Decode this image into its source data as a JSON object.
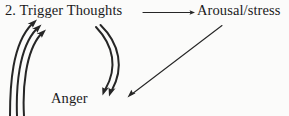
{
  "figure": {
    "kind": "cycle-diagram",
    "background_color": "#fbfbfa",
    "ink_color": "#262626",
    "item_number": "2."
  },
  "nodes": {
    "trigger": {
      "label": "2. Trigger Thoughts"
    },
    "arousal": {
      "label": "Arousal/stress"
    },
    "anger": {
      "label": "Anger"
    }
  },
  "connectors": [
    {
      "name": "trigger-to-arousal",
      "style": "straight-horizontal",
      "from": "trigger",
      "to": "arousal",
      "arrowheads": 1
    },
    {
      "name": "arousal-to-anger",
      "style": "straight-diagonal",
      "from": "arousal",
      "to": "anger",
      "arrowheads": 1
    },
    {
      "name": "trigger-to-anger",
      "style": "curved-double",
      "from": "trigger",
      "to": "anger",
      "arrowheads": 2
    },
    {
      "name": "anger-to-trigger",
      "style": "curved-triple",
      "from": "anger",
      "to": "trigger",
      "arrowheads": 3
    }
  ]
}
